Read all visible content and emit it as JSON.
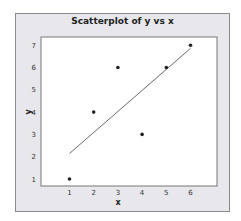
{
  "chart_data": {
    "type": "scatter",
    "title": "Scatterplot of y vs x",
    "xlabel": "x",
    "ylabel": "y",
    "xlim": [
      0,
      7
    ],
    "ylim": [
      0.7,
      7.3
    ],
    "xticks": [
      1,
      2,
      3,
      4,
      5,
      6
    ],
    "yticks": [
      1,
      2,
      3,
      4,
      5,
      6,
      7
    ],
    "grid": false,
    "legend": null,
    "points": [
      {
        "x": 1,
        "y": 1
      },
      {
        "x": 2,
        "y": 4
      },
      {
        "x": 3,
        "y": 6
      },
      {
        "x": 4,
        "y": 3
      },
      {
        "x": 5,
        "y": 6
      },
      {
        "x": 6,
        "y": 7
      }
    ],
    "fit_line": {
      "type": "linear",
      "slope": 0.943,
      "intercept": 1.2,
      "x_range": [
        1,
        6
      ]
    },
    "colors": {
      "frame_bg": "#e8e8ec",
      "plot_bg": "#ffffff",
      "points": "#222222",
      "line": "#444444"
    }
  }
}
